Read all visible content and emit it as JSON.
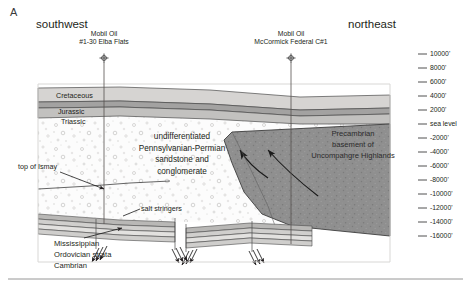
{
  "figure": {
    "panel_letter": "A",
    "direction_left": "southwest",
    "direction_right": "northeast"
  },
  "wells": [
    {
      "name": "well-elba-flats",
      "operator": "Mobil Oil",
      "well_id": "#1-30 Elba Flats",
      "x": 104
    },
    {
      "name": "well-mccormick",
      "operator": "Mobil Oil",
      "well_id": "McCormick Federal C#1",
      "x": 291
    }
  ],
  "strat_labels": {
    "cretaceous": "Cretaceous",
    "jurassic": "Jurassic",
    "triassic": "Triassic"
  },
  "annotations": {
    "center_unit": "undifferentiated\nPennsylvanian-Permian\nsandstone and\nconglomerate",
    "center_unit_lines": [
      "undifferentiated",
      "Pennsylvanian-Permian",
      "sandstone and",
      "conglomerate"
    ],
    "precambrian_lines": [
      "Precambrian",
      "basement of",
      "Uncompahgre Highlands"
    ],
    "top_of_ismay": "top of Ismay",
    "salt_stringers": "salt stringers",
    "basal_strata": [
      "Mississippian",
      "Ordovician  strata",
      "Cambrian"
    ]
  },
  "depth_scale": {
    "units": "feet",
    "ticks": [
      {
        "label": "10000'",
        "y": 54
      },
      {
        "label": "8000'",
        "y": 68
      },
      {
        "label": "6000'",
        "y": 82
      },
      {
        "label": "4000'",
        "y": 96
      },
      {
        "label": "2000'",
        "y": 110
      },
      {
        "label": "sea level",
        "y": 124
      },
      {
        "label": "-2000'",
        "y": 138
      },
      {
        "label": "-4000'",
        "y": 152
      },
      {
        "label": "-6000'",
        "y": 166
      },
      {
        "label": "-8000'",
        "y": 180
      },
      {
        "label": "-10000'",
        "y": 194
      },
      {
        "label": "-12000'",
        "y": 208
      },
      {
        "label": "-14000'",
        "y": 222
      },
      {
        "label": "-16000'",
        "y": 236
      }
    ]
  },
  "colors": {
    "cretaceous": "#d6d4d2",
    "jurassic": "#a3a2a1",
    "triassic": "#c2c1bf",
    "pennsylvanian": "#fcfcfc",
    "precambrian": "#8f8f8f",
    "salt_gray": "#b9b8b6",
    "stroke": "#3d3d3d",
    "rule": "#8b8b8b"
  }
}
